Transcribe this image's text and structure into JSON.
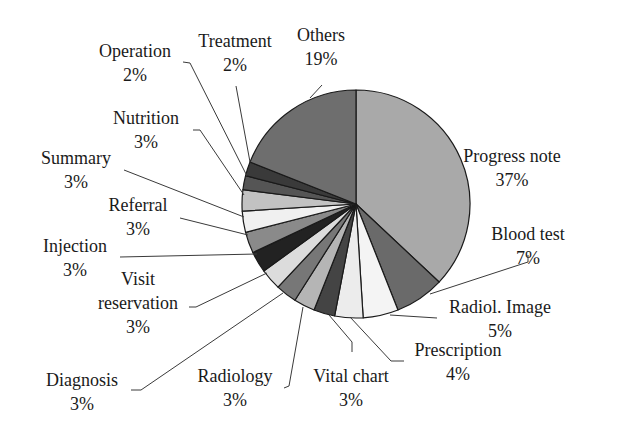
{
  "chart_data": {
    "type": "pie",
    "title": "",
    "start_angle_deg": 0,
    "direction": "clockwise",
    "center": [
      356,
      204
    ],
    "radius": 114,
    "slices": [
      {
        "label": "Progress note",
        "value": 37,
        "pct": "37%",
        "color": "#a9a9a9",
        "text_lines": [
          "Progress note",
          "37%"
        ],
        "text_pos": [
          512,
          162
        ],
        "anchor": "middle",
        "leader": null
      },
      {
        "label": "Blood test",
        "value": 7,
        "pct": "7%",
        "color": "#6a6a6a",
        "text_lines": [
          "Blood test",
          "7%"
        ],
        "text_pos": [
          528,
          240
        ],
        "anchor": "middle",
        "leader": [
          [
            430,
            294
          ],
          [
            528,
            262
          ],
          [
            528,
            255
          ]
        ]
      },
      {
        "label": "Radiol. Image",
        "value": 5,
        "pct": "5%",
        "color": "#f4f4f4",
        "text_lines": [
          "Radiol. Image",
          "5%"
        ],
        "text_pos": [
          500,
          313
        ],
        "anchor": "middle",
        "leader": [
          [
            390,
            315
          ],
          [
            437,
            318
          ]
        ]
      },
      {
        "label": "Prescription",
        "value": 4,
        "pct": "4%",
        "color": "#ececec",
        "text_lines": [
          "Prescription",
          "4%"
        ],
        "text_pos": [
          458,
          356
        ],
        "anchor": "middle",
        "leader": [
          [
            350,
            317
          ],
          [
            391,
            361
          ],
          [
            404,
            361
          ]
        ]
      },
      {
        "label": "Vital chart",
        "value": 3,
        "pct": "3%",
        "color": "#444444",
        "text_lines": [
          "Vital chart",
          "3%"
        ],
        "text_pos": [
          351,
          382
        ],
        "anchor": "middle",
        "leader": [
          [
            329,
            315
          ],
          [
            352,
            342
          ],
          [
            352,
            352
          ]
        ]
      },
      {
        "label": "Radiology",
        "value": 3,
        "pct": "3%",
        "color": "#b5b5b5",
        "text_lines": [
          "Radiology",
          "3%"
        ],
        "text_pos": [
          235,
          382
        ],
        "anchor": "middle",
        "leader": [
          [
            303,
            307
          ],
          [
            289,
            386
          ],
          [
            284,
            388
          ]
        ]
      },
      {
        "label": "Diagnosis",
        "value": 3,
        "pct": "3%",
        "color": "#777777",
        "text_lines": [
          "Diagnosis",
          "3%"
        ],
        "text_pos": [
          82,
          386
        ],
        "anchor": "middle",
        "leader": [
          [
            283,
            293
          ],
          [
            141,
            390
          ],
          [
            131,
            390
          ]
        ]
      },
      {
        "label": "Visit reservation",
        "value": 3,
        "pct": "3%",
        "color": "#dcdcdc",
        "text_lines": [
          "Visit",
          "reservation",
          "3%"
        ],
        "text_pos": [
          138,
          285
        ],
        "anchor": "middle",
        "leader": [
          [
            267,
            273
          ],
          [
            196,
            307
          ],
          [
            189,
            307
          ]
        ]
      },
      {
        "label": "Injection",
        "value": 3,
        "pct": "3%",
        "color": "#222222",
        "text_lines": [
          "Injection",
          "3%"
        ],
        "text_pos": [
          75,
          252
        ],
        "anchor": "middle",
        "leader": [
          [
            257,
            254
          ],
          [
            120,
            257
          ]
        ]
      },
      {
        "label": "Referral",
        "value": 3,
        "pct": "3%",
        "color": "#8a8a8a",
        "text_lines": [
          "Referral",
          "3%"
        ],
        "text_pos": [
          138,
          211
        ],
        "anchor": "middle",
        "leader": [
          [
            248,
            235
          ],
          [
            180,
            218
          ]
        ]
      },
      {
        "label": "Summary",
        "value": 3,
        "pct": "3%",
        "color": "#f0f0f0",
        "text_lines": [
          "Summary",
          "3%"
        ],
        "text_pos": [
          76,
          164
        ],
        "anchor": "middle",
        "leader": [
          [
            244,
            217
          ],
          [
            124,
            170
          ]
        ]
      },
      {
        "label": "Nutrition",
        "value": 3,
        "pct": "3%",
        "color": "#c2c2c2",
        "text_lines": [
          "Nutrition",
          "3%"
        ],
        "text_pos": [
          146,
          124
        ],
        "anchor": "middle",
        "leader": [
          [
            244,
            195
          ],
          [
            200,
            130
          ],
          [
            193,
            130
          ]
        ]
      },
      {
        "label": "Operation",
        "value": 2,
        "pct": "2%",
        "color": "#555555",
        "text_lines": [
          "Operation",
          "2%"
        ],
        "text_pos": [
          135,
          57
        ],
        "anchor": "middle",
        "leader": [
          [
            247,
            176
          ],
          [
            190,
            63
          ],
          [
            183,
            62
          ]
        ]
      },
      {
        "label": "Treatment",
        "value": 2,
        "pct": "2%",
        "color": "#3a3a3a",
        "text_lines": [
          "Treatment",
          "2%"
        ],
        "text_pos": [
          235,
          47
        ],
        "anchor": "middle",
        "leader": [
          [
            250,
            162
          ],
          [
            236,
            86
          ]
        ]
      },
      {
        "label": "Others",
        "value": 19,
        "pct": "19%",
        "color": "#6e6e6e",
        "text_lines": [
          "Others",
          "19%"
        ],
        "text_pos": [
          321,
          41
        ],
        "anchor": "middle",
        "leader": [
          [
            310,
            98
          ],
          [
            322,
            85
          ]
        ]
      }
    ],
    "legend": null,
    "edge_color": "#1a1a1a",
    "leader_color": "#3a3a3a"
  }
}
